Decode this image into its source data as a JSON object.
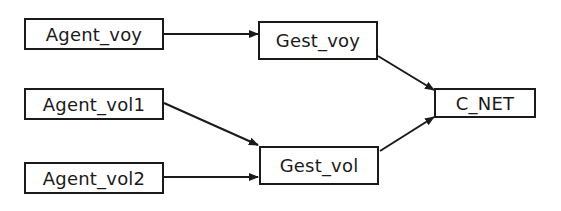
{
  "diagram": {
    "type": "flow",
    "colors": {
      "stroke": "#1a1a1a",
      "background": "#ffffff"
    },
    "nodes": [
      {
        "id": "agent_voy",
        "label": "Agent_voy",
        "x": 24,
        "y": 18,
        "w": 140,
        "h": 32
      },
      {
        "id": "agent_vol1",
        "label": "Agent_vol1",
        "x": 24,
        "y": 88,
        "w": 140,
        "h": 32
      },
      {
        "id": "agent_vol2",
        "label": "Agent_vol2",
        "x": 24,
        "y": 162,
        "w": 140,
        "h": 32
      },
      {
        "id": "gest_voy",
        "label": "Gest_voy",
        "x": 258,
        "y": 21,
        "w": 120,
        "h": 39
      },
      {
        "id": "gest_vol",
        "label": "Gest_vol",
        "x": 259,
        "y": 146,
        "w": 120,
        "h": 39
      },
      {
        "id": "c_net",
        "label": "C_NET",
        "x": 434,
        "y": 88,
        "w": 102,
        "h": 30
      }
    ],
    "edges": [
      {
        "from": "agent_voy",
        "to": "gest_voy"
      },
      {
        "from": "agent_vol1",
        "to": "gest_vol"
      },
      {
        "from": "agent_vol2",
        "to": "gest_vol"
      },
      {
        "from": "gest_voy",
        "to": "c_net"
      },
      {
        "from": "gest_vol",
        "to": "c_net"
      }
    ]
  }
}
